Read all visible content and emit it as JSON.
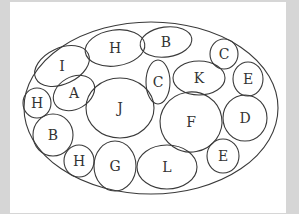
{
  "diagram": {
    "outer": {
      "cx": 151,
      "cy": 108,
      "rx": 127,
      "ry": 86
    },
    "ellipses": [
      {
        "label": "H",
        "cx": 115,
        "cy": 48,
        "rx": 30,
        "ry": 18,
        "rot": -8
      },
      {
        "label": "B",
        "cx": 166,
        "cy": 42,
        "rx": 26,
        "ry": 15,
        "rot": -8
      },
      {
        "label": "C",
        "cx": 224,
        "cy": 54,
        "rx": 14,
        "ry": 15,
        "rot": 0
      },
      {
        "label": "I",
        "cx": 62,
        "cy": 66,
        "rx": 29,
        "ry": 18,
        "rot": -25
      },
      {
        "label": "A",
        "cx": 74,
        "cy": 93,
        "rx": 22,
        "ry": 16,
        "rot": -30
      },
      {
        "label": "C",
        "cx": 158,
        "cy": 82,
        "rx": 12,
        "ry": 22,
        "rot": 0
      },
      {
        "label": "K",
        "cx": 199,
        "cy": 78,
        "rx": 26,
        "ry": 17,
        "rot": 0
      },
      {
        "label": "E",
        "cx": 248,
        "cy": 79,
        "rx": 15,
        "ry": 17,
        "rot": 0
      },
      {
        "label": "H",
        "cx": 37,
        "cy": 103,
        "rx": 14,
        "ry": 15,
        "rot": 0
      },
      {
        "label": "J",
        "cx": 120,
        "cy": 108,
        "rx": 34,
        "ry": 30,
        "rot": 0
      },
      {
        "label": "F",
        "cx": 191,
        "cy": 122,
        "rx": 31,
        "ry": 30,
        "rot": -10
      },
      {
        "label": "D",
        "cx": 245,
        "cy": 118,
        "rx": 22,
        "ry": 23,
        "rot": 0
      },
      {
        "label": "B",
        "cx": 53,
        "cy": 135,
        "rx": 20,
        "ry": 21,
        "rot": 0
      },
      {
        "label": "H",
        "cx": 79,
        "cy": 161,
        "rx": 15,
        "ry": 16,
        "rot": 0
      },
      {
        "label": "G",
        "cx": 115,
        "cy": 166,
        "rx": 21,
        "ry": 25,
        "rot": 0
      },
      {
        "label": "L",
        "cx": 167,
        "cy": 167,
        "rx": 30,
        "ry": 22,
        "rot": 0
      },
      {
        "label": "E",
        "cx": 223,
        "cy": 156,
        "rx": 16,
        "ry": 17,
        "rot": 0
      }
    ],
    "stroke_color": "#3a3a3a",
    "background_color": "#d6d6d6",
    "card_color": "#ffffff"
  }
}
